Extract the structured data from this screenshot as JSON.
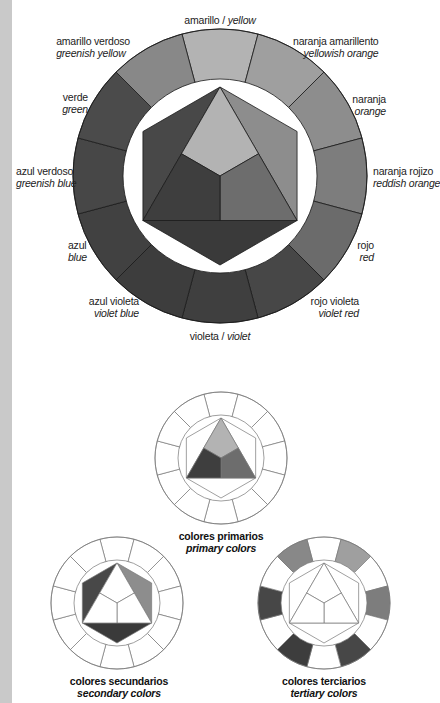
{
  "main_wheel": {
    "center": [
      220,
      176
    ],
    "outer_r": 147,
    "inner_r": 97,
    "hex_r": 89,
    "segments": [
      {
        "es": "amarillo",
        "en": "yellow",
        "gray": "#b3b3b3"
      },
      {
        "es": "naranja amarillento",
        "en": "yellowish orange",
        "gray": "#9f9f9f"
      },
      {
        "es": "naranja",
        "en": "orange",
        "gray": "#8d8d8d"
      },
      {
        "es": "naranja rojizo",
        "en": "reddish orange",
        "gray": "#7d7d7d"
      },
      {
        "es": "rojo",
        "en": "red",
        "gray": "#6b6b6b"
      },
      {
        "es": "rojo violeta",
        "en": "violet red",
        "gray": "#474747"
      },
      {
        "es": "violeta",
        "en": "violet",
        "gray": "#3f3f3f"
      },
      {
        "es": "azul violeta",
        "en": "violet blue",
        "gray": "#3d3d3d"
      },
      {
        "es": "azul",
        "en": "blue",
        "gray": "#414141"
      },
      {
        "es": "azul verdoso",
        "en": "greenish blue",
        "gray": "#474747"
      },
      {
        "es": "verde",
        "en": "green",
        "gray": "#4b4b4b"
      },
      {
        "es": "amarillo verdoso",
        "en": "greenish yellow",
        "gray": "#888888"
      }
    ],
    "inner": {
      "primary_yellow": "#b3b3b3",
      "primary_red": "#6d6d6d",
      "primary_blue": "#3e3e3e",
      "secondary_orange": "#8d8d8d",
      "secondary_violet": "#3a3a3a",
      "secondary_green": "#484848"
    }
  },
  "labels": {
    "yellow": {
      "es": "amarillo",
      "sep": " / ",
      "en": "yellow"
    },
    "yellowish_orange": {
      "es": "naranja amarillento",
      "en": "yellowish orange"
    },
    "orange": {
      "es": "naranja",
      "en": "orange"
    },
    "reddish_orange": {
      "es": "naranja rojizo",
      "en": "reddish orange"
    },
    "red": {
      "es": "rojo",
      "en": "red"
    },
    "violet_red": {
      "es": "rojo violeta",
      "en": "violet red"
    },
    "violet": {
      "es": "violeta",
      "sep": " / ",
      "en": "violet"
    },
    "violet_blue": {
      "es": "azul violeta",
      "en": "violet blue"
    },
    "blue": {
      "es": "azul",
      "en": "blue"
    },
    "greenish_blue": {
      "es": "azul verdoso",
      "en": "greenish blue"
    },
    "green": {
      "es": "verde",
      "en": "green"
    },
    "greenish_yellow": {
      "es": "amarillo verdoso",
      "en": "greenish yellow"
    }
  },
  "small_wheels": [
    {
      "id": "primary",
      "center": [
        221,
        458
      ],
      "caption_es": "colores primarios",
      "caption_en": "primary colors"
    },
    {
      "id": "secondary",
      "center": [
        117,
        603
      ],
      "caption_es": "colores secundarios",
      "caption_en": "secondary colors"
    },
    {
      "id": "tertiary",
      "center": [
        324,
        603
      ],
      "caption_es": "colores terciarios",
      "caption_en": "tertiary colors"
    }
  ],
  "small_wheel_geom": {
    "outer_r": 66,
    "inner_r": 43,
    "hex_r": 40,
    "stroke": "#777777"
  }
}
